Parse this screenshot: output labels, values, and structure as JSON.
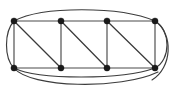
{
  "figure": {
    "description": "Planar-style graph drawing: a 4-by-2 grid of eight vertices forming three square cells, each cell containing a diagonal edge from its top-left vertex to its bottom-right vertex, enclosed by an outer ellipse-like curve joining the four corner vertices, with an additional arc below the bottom row.",
    "background_color": "#ffffff",
    "vertex_color": "#1a1a1a",
    "edge_color": "#4a4a4a",
    "curve_color": "#3c3c3c",
    "vertex_radius": 3.1,
    "edge_width": 1.15
  },
  "chart_data": {
    "type": "diagram",
    "title": "",
    "xlabel": "",
    "ylabel": "",
    "vertex_count": 8,
    "edge_count": 16,
    "vertices": [
      {
        "id": "t1",
        "label": "",
        "x": 14.0,
        "y": 21.0,
        "row": "top",
        "col": 1
      },
      {
        "id": "t2",
        "label": "",
        "x": 61.0,
        "y": 21.0,
        "row": "top",
        "col": 2
      },
      {
        "id": "t3",
        "label": "",
        "x": 107.0,
        "y": 21.0,
        "row": "top",
        "col": 3
      },
      {
        "id": "t4",
        "label": "",
        "x": 155.0,
        "y": 21.0,
        "row": "top",
        "col": 4
      },
      {
        "id": "b1",
        "label": "",
        "x": 14.0,
        "y": 68.0,
        "row": "bottom",
        "col": 1
      },
      {
        "id": "b2",
        "label": "",
        "x": 61.0,
        "y": 68.0,
        "row": "bottom",
        "col": 2
      },
      {
        "id": "b3",
        "label": "",
        "x": 107.0,
        "y": 68.0,
        "row": "bottom",
        "col": 3
      },
      {
        "id": "b4",
        "label": "",
        "x": 155.0,
        "y": 68.0,
        "row": "bottom",
        "col": 4
      }
    ],
    "edges": [
      {
        "id": "e-top-1",
        "from": "t1",
        "to": "t2",
        "kind": "straight"
      },
      {
        "id": "e-top-2",
        "from": "t2",
        "to": "t3",
        "kind": "straight"
      },
      {
        "id": "e-top-3",
        "from": "t3",
        "to": "t4",
        "kind": "straight"
      },
      {
        "id": "e-bot-1",
        "from": "b1",
        "to": "b2",
        "kind": "straight"
      },
      {
        "id": "e-bot-2",
        "from": "b2",
        "to": "b3",
        "kind": "straight"
      },
      {
        "id": "e-bot-3",
        "from": "b3",
        "to": "b4",
        "kind": "straight"
      },
      {
        "id": "e-vert-1",
        "from": "t1",
        "to": "b1",
        "kind": "straight"
      },
      {
        "id": "e-vert-2",
        "from": "t2",
        "to": "b2",
        "kind": "straight"
      },
      {
        "id": "e-vert-3",
        "from": "t3",
        "to": "b3",
        "kind": "straight"
      },
      {
        "id": "e-vert-4",
        "from": "t4",
        "to": "b4",
        "kind": "straight"
      },
      {
        "id": "e-diag-1",
        "from": "t1",
        "to": "b2",
        "kind": "diagonal"
      },
      {
        "id": "e-diag-2",
        "from": "t2",
        "to": "b3",
        "kind": "diagonal"
      },
      {
        "id": "e-diag-3",
        "from": "t3",
        "to": "b4",
        "kind": "diagonal"
      },
      {
        "id": "e-arc-top",
        "from": "t1",
        "to": "t4",
        "kind": "curve",
        "bulge": "up"
      },
      {
        "id": "e-arc-right",
        "from": "t4",
        "to": "b4",
        "kind": "curve",
        "bulge": "right"
      },
      {
        "id": "e-arc-bottom",
        "from": "b1",
        "to": "b4",
        "kind": "curve",
        "bulge": "down"
      },
      {
        "id": "e-arc-bottom-outer",
        "from": "b1",
        "to": "b4",
        "kind": "curve",
        "bulge": "down-outer"
      }
    ]
  }
}
